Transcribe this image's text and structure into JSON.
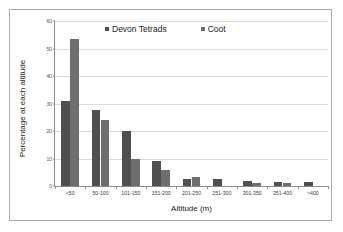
{
  "chart_data": {
    "type": "bar",
    "title": "",
    "xlabel": "Altitude (m)",
    "ylabel": "Percentage at each altitude",
    "categories": [
      "<50",
      "50-100",
      "101-150",
      "151-200",
      "201-250",
      "251-300",
      "301-350",
      "351-400",
      ">400"
    ],
    "series": [
      {
        "name": "Devon Tetrads",
        "color": "#4f4f4f",
        "values": [
          31,
          27.5,
          20,
          9,
          2.5,
          2.6,
          2,
          1.6,
          1.5
        ]
      },
      {
        "name": "Coot",
        "color": "#6e6e6e",
        "values": [
          53.5,
          24,
          9.8,
          6,
          3.4,
          0,
          1.1,
          1.1,
          0
        ]
      }
    ],
    "ylim": [
      0,
      60
    ],
    "ytick_values": [
      0,
      10,
      20,
      30,
      40,
      50,
      60
    ],
    "ytick_labels": [
      "0",
      "10",
      "20",
      "30",
      "40",
      "50",
      "60"
    ],
    "grid": "horizontal",
    "legend_position": "top-center"
  },
  "legend": {
    "entries": [
      {
        "label": "Devon Tetrads"
      },
      {
        "label": "Coot"
      }
    ]
  },
  "axes": {
    "x_title": "Altitude (m)",
    "y_title": "Percentage at each altitude"
  }
}
